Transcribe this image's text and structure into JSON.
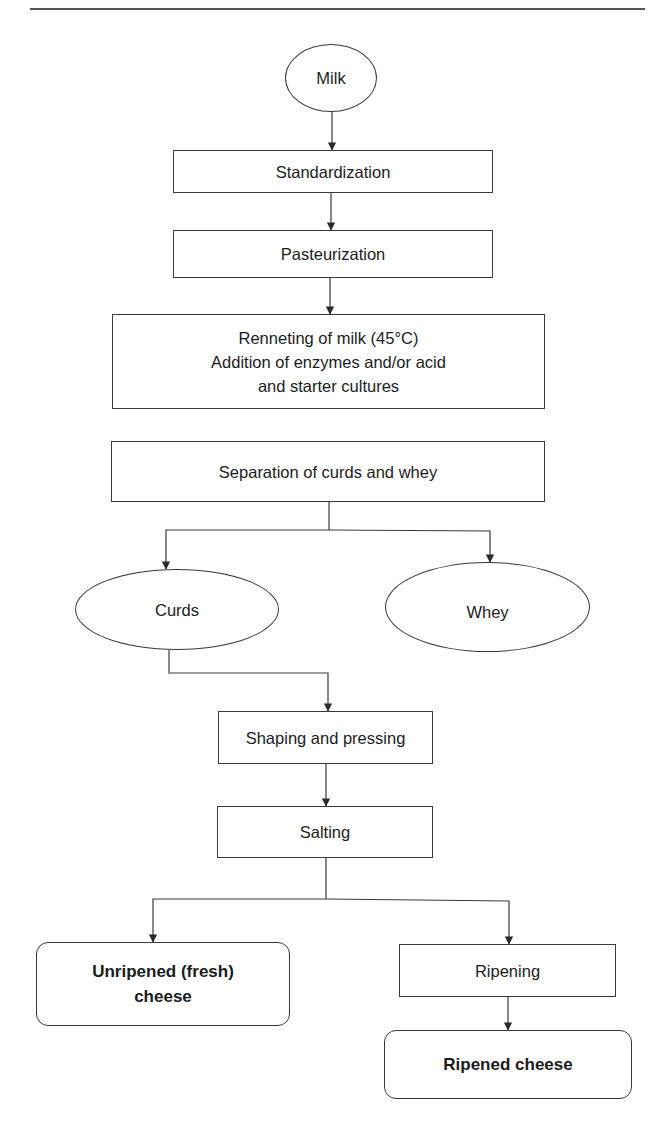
{
  "diagram": {
    "type": "flowchart",
    "nodes": {
      "milk": {
        "label": "Milk",
        "shape": "ellipse"
      },
      "standardization": {
        "label": "Standardization",
        "shape": "rectangle"
      },
      "pasteurization": {
        "label": "Pasteurization",
        "shape": "rectangle"
      },
      "renneting": {
        "shape": "rectangle",
        "lines": [
          "Renneting of milk (45°C)",
          "Addition of enzymes and/or acid",
          "and starter cultures"
        ]
      },
      "separation": {
        "label": "Separation of curds and whey",
        "shape": "rectangle"
      },
      "curds": {
        "label": "Curds",
        "shape": "ellipse"
      },
      "whey": {
        "label": "Whey",
        "shape": "ellipse"
      },
      "shaping": {
        "label": "Shaping and pressing",
        "shape": "rectangle"
      },
      "salting": {
        "label": "Salting",
        "shape": "rectangle"
      },
      "unripened": {
        "lines": [
          "Unripened (fresh)",
          "cheese"
        ],
        "shape": "rounded-rectangle",
        "bold": true
      },
      "ripening": {
        "label": "Ripening",
        "shape": "rectangle"
      },
      "ripened": {
        "label": "Ripened cheese",
        "shape": "rounded-rectangle",
        "bold": true
      }
    },
    "edges": [
      {
        "from": "milk",
        "to": "standardization"
      },
      {
        "from": "standardization",
        "to": "pasteurization"
      },
      {
        "from": "pasteurization",
        "to": "renneting"
      },
      {
        "from": "separation",
        "to": "curds"
      },
      {
        "from": "separation",
        "to": "whey"
      },
      {
        "from": "curds",
        "to": "shaping"
      },
      {
        "from": "shaping",
        "to": "salting"
      },
      {
        "from": "salting",
        "to": "unripened"
      },
      {
        "from": "salting",
        "to": "ripening"
      },
      {
        "from": "ripening",
        "to": "ripened"
      }
    ],
    "colors": {
      "stroke": "#3a3a3a",
      "text": "#1c1c1c",
      "background": "#ffffff"
    }
  }
}
